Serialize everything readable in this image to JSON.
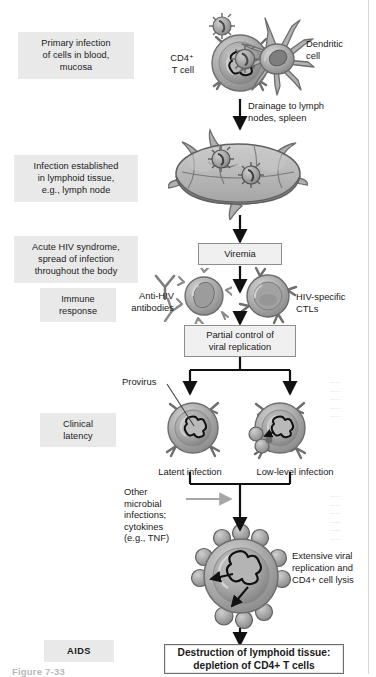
{
  "figure": {
    "caption": "Figure 7-33"
  },
  "stage_labels": [
    {
      "id": "primary-infection",
      "text": "Primary infection\nof cells in blood,\nmucosa",
      "emphasis": "normal"
    },
    {
      "id": "infection-established",
      "text": "Infection established\nin lymphoid tissue,\ne.g., lymph node",
      "emphasis": "normal"
    },
    {
      "id": "acute-hiv-syndrome",
      "text": "Acute HIV syndrome,\nspread of infection\nthroughout the body",
      "emphasis": "normal"
    },
    {
      "id": "immune-response",
      "text": "Immune\nresponse",
      "emphasis": "normal"
    },
    {
      "id": "clinical-latency",
      "text": "Clinical\nlatency",
      "emphasis": "normal"
    },
    {
      "id": "aids",
      "text": "AIDS",
      "emphasis": "strong"
    }
  ],
  "process_boxes": [
    {
      "id": "viremia",
      "text": "Viremia"
    },
    {
      "id": "partial-control",
      "text": "Partial control of\nviral replication"
    },
    {
      "id": "destruction",
      "text": "Destruction of lymphoid tissue:\ndepletion of CD4+ T cells"
    }
  ],
  "annotations": [
    {
      "id": "cd4-t-cell",
      "text": "CD4⁺\nT cell"
    },
    {
      "id": "dendritic-cell",
      "text": "Dendritic\ncell"
    },
    {
      "id": "drainage",
      "text": "Drainage to lymph\nnodes, spleen"
    },
    {
      "id": "anti-hiv-antibodies",
      "text": "Anti-HIV\nantibodies"
    },
    {
      "id": "hiv-specific-ctls",
      "text": "HIV-specific\nCTLs"
    },
    {
      "id": "provirus",
      "text": "Provirus"
    },
    {
      "id": "latent-infection",
      "text": "Latent infection"
    },
    {
      "id": "low-level-infection",
      "text": "Low-level infection"
    },
    {
      "id": "other-microbial",
      "text": "Other\nmicrobial\ninfections;\ncytokines\n(e.g., TNF)"
    },
    {
      "id": "extensive-replication",
      "text": "Extensive viral\nreplication and\nCD4+ cell lysis"
    }
  ],
  "ghost_text": {
    "block_a": "——\n——\n——\n——\n——",
    "block_b": "——\n——\n——\n——\n——\n——"
  },
  "colors": {
    "chip_bg": "#e9e9e9",
    "box_bg": "#f0f0f0",
    "box_border": "#8e8e8e",
    "terminal_border": "#6f6f6f",
    "arrow": "#1a1a1a",
    "cell_membrane": "#8d8d8d",
    "cell_cytoplasm": "#b4b4b4",
    "cell_nucleus": "#a0a0a0",
    "virion": "#9a9a9a",
    "text": "#1a1a1a",
    "edge_rule": "#d8d8d8",
    "page": "#ffffff"
  }
}
